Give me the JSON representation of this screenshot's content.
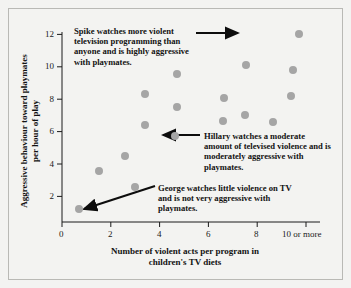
{
  "chart_data": {
    "type": "scatter",
    "title": "",
    "xlabel": "Number of violent acts per program in children's TV diets",
    "ylabel": "Aggressive behaviour toward playmates per hour of play",
    "xlim": [
      0,
      10.6
    ],
    "ylim": [
      0,
      12.6
    ],
    "xticks": [
      0,
      2,
      4,
      6,
      8,
      10
    ],
    "xticklabels": [
      "0",
      "2",
      "4",
      "6",
      "8",
      "10 or more"
    ],
    "yticks": [
      2,
      4,
      6,
      8,
      10,
      12
    ],
    "yticklabels": [
      "2",
      "4",
      "6",
      "8",
      "10",
      "12"
    ],
    "grid": false,
    "legend": "none",
    "marker_color": "#a5a5a5",
    "points": [
      {
        "x": 0.7,
        "y": 0.8,
        "label": "George"
      },
      {
        "x": 1.5,
        "y": 3.25,
        "label": ""
      },
      {
        "x": 2.6,
        "y": 4.25,
        "label": ""
      },
      {
        "x": 3.0,
        "y": 2.25,
        "label": ""
      },
      {
        "x": 3.4,
        "y": 6.2,
        "label": ""
      },
      {
        "x": 3.4,
        "y": 8.2,
        "label": ""
      },
      {
        "x": 4.65,
        "y": 5.5,
        "label": "Hillary"
      },
      {
        "x": 4.7,
        "y": 7.35,
        "label": ""
      },
      {
        "x": 4.7,
        "y": 9.45,
        "label": ""
      },
      {
        "x": 6.6,
        "y": 6.45,
        "label": ""
      },
      {
        "x": 6.65,
        "y": 7.9,
        "label": ""
      },
      {
        "x": 7.5,
        "y": 6.85,
        "label": ""
      },
      {
        "x": 7.55,
        "y": 10.05,
        "label": ""
      },
      {
        "x": 8.65,
        "y": 6.4,
        "label": ""
      },
      {
        "x": 9.4,
        "y": 8.05,
        "label": ""
      },
      {
        "x": 9.45,
        "y": 9.75,
        "label": ""
      },
      {
        "x": 9.7,
        "y": 12.05,
        "label": "Spike"
      }
    ],
    "annotations": [
      {
        "id": "spike",
        "text": "Spike watches more violent television programming than anyone and is highly aggressive with playmates.",
        "points_to": {
          "x": 9.7,
          "y": 12.05
        }
      },
      {
        "id": "hillary",
        "text": "Hillary watches a moderate amount of televised violence and is moderately aggressive with playmates.",
        "points_to": {
          "x": 4.65,
          "y": 5.5
        }
      },
      {
        "id": "george",
        "text": "George watches little violence on TV and is not very aggressive with playmates.",
        "points_to": {
          "x": 0.7,
          "y": 0.8
        }
      }
    ]
  },
  "axis": {
    "x_title_line1": "Number of violent acts per program in",
    "x_title_line2": "children's TV diets",
    "y_title_line1": "Aggressive behaviour toward playmates",
    "y_title_line2": "per hour of play"
  }
}
